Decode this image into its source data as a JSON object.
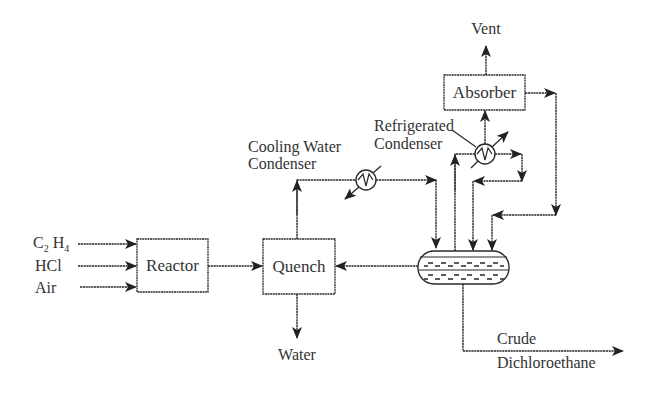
{
  "diagram": {
    "title": "",
    "inputs": {
      "feed_1": {
        "base": "C",
        "sub1": "2",
        "base2": "H",
        "sub2": "4"
      },
      "feed_2": "HCl",
      "feed_3": "Air"
    },
    "units": {
      "reactor": "Reactor",
      "quench": "Quench",
      "absorber": "Absorber"
    },
    "labels": {
      "cooling_water_condenser_line1": "Cooling Water",
      "cooling_water_condenser_line2": "Condenser",
      "refrigerated_condenser_line1": "Refrigerated",
      "refrigerated_condenser_line2": "Condenser",
      "vent": "Vent",
      "water": "Water",
      "product_line1": "Crude",
      "product_line2": "Dichloroethane"
    },
    "nodes": [
      "C2H4",
      "HCl",
      "Air",
      "Reactor",
      "Quench",
      "Cooling Water Condenser",
      "Separator Drum",
      "Refrigerated Condenser",
      "Absorber",
      "Vent",
      "Water",
      "Crude Dichloroethane"
    ],
    "edges": [
      {
        "from": "C2H4",
        "to": "Reactor"
      },
      {
        "from": "HCl",
        "to": "Reactor"
      },
      {
        "from": "Air",
        "to": "Reactor"
      },
      {
        "from": "Reactor",
        "to": "Quench"
      },
      {
        "from": "Quench",
        "to": "Water"
      },
      {
        "from": "Quench",
        "to": "Cooling Water Condenser"
      },
      {
        "from": "Cooling Water Condenser",
        "to": "Separator Drum"
      },
      {
        "from": "Separator Drum",
        "to": "Quench"
      },
      {
        "from": "Separator Drum",
        "to": "Refrigerated Condenser"
      },
      {
        "from": "Refrigerated Condenser",
        "to": "Absorber"
      },
      {
        "from": "Refrigerated Condenser",
        "to": "Separator Drum"
      },
      {
        "from": "Absorber",
        "to": "Vent"
      },
      {
        "from": "Absorber",
        "to": "Separator Drum"
      },
      {
        "from": "Separator Drum",
        "to": "Crude Dichloroethane"
      }
    ]
  }
}
